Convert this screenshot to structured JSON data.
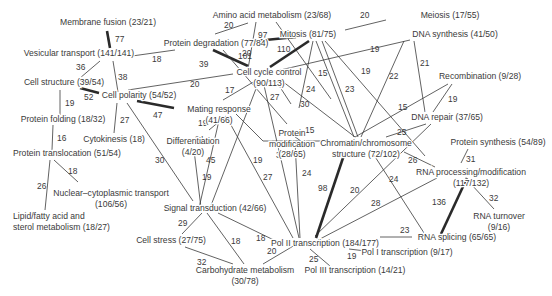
{
  "diagram": {
    "type": "network",
    "nodes": [
      {
        "id": "membrane_fusion",
        "lines": [
          "Membrane fusion (23/21)"
        ],
        "x": 108,
        "y": 25,
        "anchor": "middle"
      },
      {
        "id": "vesicular_transport",
        "lines": [
          "Vesicular transport (141/141)"
        ],
        "x": 79,
        "y": 56,
        "anchor": "middle"
      },
      {
        "id": "cell_structure",
        "lines": [
          "Cell structure (39/54)"
        ],
        "x": 64,
        "y": 85,
        "anchor": "middle"
      },
      {
        "id": "cell_polarity",
        "lines": [
          "Cell polarity (54/52)"
        ],
        "x": 139,
        "y": 98,
        "anchor": "middle"
      },
      {
        "id": "protein_folding",
        "lines": [
          "Protein folding (18/32)"
        ],
        "x": 63,
        "y": 122,
        "anchor": "middle"
      },
      {
        "id": "cytokinesis",
        "lines": [
          "Cytokinesis (18)"
        ],
        "x": 114,
        "y": 142,
        "anchor": "middle"
      },
      {
        "id": "protein_translocation",
        "lines": [
          "Protein translocation (51/54)"
        ],
        "x": 67,
        "y": 156,
        "anchor": "middle"
      },
      {
        "id": "nuclear_cytoplasmic",
        "lines": [
          "Nuclear–cytoplasmic transport",
          "(106/56)"
        ],
        "x": 111,
        "y": 196,
        "anchor": "middle"
      },
      {
        "id": "lipid",
        "lines": [
          "Lipid/fatty acid and",
          "sterol metabolism (18/27)"
        ],
        "x": 13,
        "y": 219,
        "anchor": "start"
      },
      {
        "id": "amino_acid",
        "lines": [
          "Amino acid metabolism (23/68)"
        ],
        "x": 272,
        "y": 18,
        "anchor": "middle"
      },
      {
        "id": "meiosis",
        "lines": [
          "Meiosis (17/55)"
        ],
        "x": 450,
        "y": 18,
        "anchor": "middle"
      },
      {
        "id": "protein_degradation",
        "lines": [
          "Protein degradation (77/84)"
        ],
        "x": 216,
        "y": 46,
        "anchor": "middle"
      },
      {
        "id": "mitosis",
        "lines": [
          "Mitosis (81/75)"
        ],
        "x": 308,
        "y": 37,
        "anchor": "middle"
      },
      {
        "id": "dna_synthesis",
        "lines": [
          "DNA synthesis (41/50)"
        ],
        "x": 455,
        "y": 37,
        "anchor": "middle"
      },
      {
        "id": "cell_cycle_control",
        "lines": [
          "Cell cycle control",
          "(90/113)"
        ],
        "x": 269,
        "y": 75,
        "anchor": "middle"
      },
      {
        "id": "mating_response",
        "lines": [
          "Mating response",
          "(41/66)"
        ],
        "x": 219,
        "y": 112,
        "anchor": "middle"
      },
      {
        "id": "protein_modification",
        "lines": [
          "Protein",
          "modification",
          "(28/65)"
        ],
        "x": 292,
        "y": 136,
        "anchor": "middle"
      },
      {
        "id": "differentiation",
        "lines": [
          "Differentiation",
          "(4/20)"
        ],
        "x": 193,
        "y": 144,
        "anchor": "middle"
      },
      {
        "id": "recombination",
        "lines": [
          "Recombination (9/28)"
        ],
        "x": 480,
        "y": 79,
        "anchor": "middle"
      },
      {
        "id": "dna_repair",
        "lines": [
          "DNA repair (37/65)"
        ],
        "x": 447,
        "y": 120,
        "anchor": "middle"
      },
      {
        "id": "chromatin",
        "lines": [
          "Chromatin/chromosome",
          "structure (72/102)"
        ],
        "x": 366,
        "y": 146,
        "anchor": "middle"
      },
      {
        "id": "protein_synthesis",
        "lines": [
          "Protein synthesis (54/89)"
        ],
        "x": 498,
        "y": 145,
        "anchor": "middle"
      },
      {
        "id": "rna_processing",
        "lines": [
          "RNA processing/modification",
          "(117/132)"
        ],
        "x": 471,
        "y": 175,
        "anchor": "middle"
      },
      {
        "id": "rna_turnover",
        "lines": [
          "RNA turnover",
          "(9/16)"
        ],
        "x": 499,
        "y": 219,
        "anchor": "middle"
      },
      {
        "id": "signal_transduction",
        "lines": [
          "Signal transduction (42/66)"
        ],
        "x": 215,
        "y": 211,
        "anchor": "middle"
      },
      {
        "id": "rna_splicing",
        "lines": [
          "RNA splicing (65/65)"
        ],
        "x": 457,
        "y": 240,
        "anchor": "middle"
      },
      {
        "id": "cell_stress",
        "lines": [
          "Cell stress (27/75)"
        ],
        "x": 171,
        "y": 243,
        "anchor": "middle"
      },
      {
        "id": "pol2",
        "lines": [
          "Pol II transcription (184/177)"
        ],
        "x": 325,
        "y": 246,
        "anchor": "middle"
      },
      {
        "id": "pol1",
        "lines": [
          "Pol I transcription (9/17)"
        ],
        "x": 407,
        "y": 255,
        "anchor": "middle"
      },
      {
        "id": "carbohydrate",
        "lines": [
          "Carbohydrate metabolism",
          "(30/78)"
        ],
        "x": 245,
        "y": 273,
        "anchor": "middle"
      },
      {
        "id": "pol3",
        "lines": [
          "Pol III transcription (14/21)"
        ],
        "x": 355,
        "y": 273,
        "anchor": "middle"
      }
    ],
    "edges": [
      {
        "x1": 107,
        "y1": 31,
        "x2": 110,
        "y2": 48,
        "weight": "77",
        "lx": 115,
        "ly": 42,
        "thick": true
      },
      {
        "x1": 132,
        "y1": 56,
        "x2": 175,
        "y2": 50,
        "weight": "18",
        "lx": 152,
        "ly": 62,
        "thick": false
      },
      {
        "x1": 100,
        "y1": 61,
        "x2": 80,
        "y2": 78,
        "weight": "36",
        "lx": 76,
        "ly": 70,
        "thick": false
      },
      {
        "x1": 113,
        "y1": 61,
        "x2": 118,
        "y2": 92,
        "weight": "38",
        "lx": 118,
        "ly": 80,
        "thick": false
      },
      {
        "x1": 80,
        "y1": 88,
        "x2": 99,
        "y2": 93,
        "weight": "52",
        "lx": 84,
        "ly": 100,
        "thick": true
      },
      {
        "x1": 128,
        "y1": 90,
        "x2": 233,
        "y2": 74,
        "weight": "20",
        "lx": 190,
        "ly": 87,
        "thick": false
      },
      {
        "x1": 60,
        "y1": 90,
        "x2": 60,
        "y2": 115,
        "weight": "19",
        "lx": 65,
        "ly": 106,
        "thick": false
      },
      {
        "x1": 117,
        "y1": 103,
        "x2": 114,
        "y2": 133,
        "weight": "27",
        "lx": 120,
        "ly": 123,
        "thick": false
      },
      {
        "x1": 137,
        "y1": 101,
        "x2": 174,
        "y2": 108,
        "weight": "47",
        "lx": 153,
        "ly": 118,
        "thick": true
      },
      {
        "x1": 127,
        "y1": 103,
        "x2": 193,
        "y2": 201,
        "weight": "30",
        "lx": 155,
        "ly": 163,
        "thick": false
      },
      {
        "x1": 53,
        "y1": 125,
        "x2": 52,
        "y2": 150,
        "weight": "16",
        "lx": 57,
        "ly": 141,
        "thick": false
      },
      {
        "x1": 54,
        "y1": 160,
        "x2": 78,
        "y2": 182,
        "weight": "18",
        "lx": 68,
        "ly": 174,
        "thick": false
      },
      {
        "x1": 50,
        "y1": 160,
        "x2": 45,
        "y2": 210,
        "weight": "26",
        "lx": 37,
        "ly": 189,
        "thick": false
      },
      {
        "x1": 215,
        "y1": 34,
        "x2": 248,
        "y2": 23,
        "weight": "20",
        "lx": 224,
        "ly": 28,
        "thick": false
      },
      {
        "x1": 256,
        "y1": 22,
        "x2": 248,
        "y2": 69,
        "weight": "20",
        "lx": 242,
        "ly": 56,
        "thick": false
      },
      {
        "x1": 276,
        "y1": 22,
        "x2": 331,
        "y2": 99,
        "weight": "",
        "lx": 0,
        "ly": 0,
        "thick": false
      },
      {
        "x1": 255,
        "y1": 41,
        "x2": 296,
        "y2": 37,
        "weight": "97",
        "lx": 258,
        "ly": 38,
        "thick": true
      },
      {
        "x1": 213,
        "y1": 50,
        "x2": 248,
        "y2": 66,
        "weight": "101",
        "lx": 238,
        "ly": 59,
        "thick": true
      },
      {
        "x1": 309,
        "y1": 41,
        "x2": 270,
        "y2": 67,
        "weight": "110",
        "lx": 277,
        "ly": 52,
        "thick": true
      },
      {
        "x1": 386,
        "y1": 20,
        "x2": 345,
        "y2": 30,
        "weight": "20",
        "lx": 360,
        "ly": 18,
        "thick": false
      },
      {
        "x1": 223,
        "y1": 50,
        "x2": 287,
        "y2": 124,
        "weight": "39",
        "lx": 199,
        "ly": 67,
        "thick": false
      },
      {
        "x1": 410,
        "y1": 40,
        "x2": 276,
        "y2": 71,
        "weight": "19",
        "lx": 370,
        "ly": 52,
        "thick": false
      },
      {
        "x1": 313,
        "y1": 41,
        "x2": 299,
        "y2": 108,
        "weight": "24",
        "lx": 306,
        "ly": 92,
        "thick": false
      },
      {
        "x1": 316,
        "y1": 41,
        "x2": 354,
        "y2": 137,
        "weight": "15",
        "lx": 318,
        "ly": 76,
        "thick": false
      },
      {
        "x1": 322,
        "y1": 41,
        "x2": 358,
        "y2": 137,
        "weight": "23",
        "lx": 345,
        "ly": 92,
        "thick": false
      },
      {
        "x1": 325,
        "y1": 41,
        "x2": 425,
        "y2": 156,
        "weight": "19",
        "lx": 361,
        "ly": 74,
        "thick": false
      },
      {
        "x1": 404,
        "y1": 41,
        "x2": 361,
        "y2": 137,
        "weight": "22",
        "lx": 389,
        "ly": 79,
        "thick": false
      },
      {
        "x1": 414,
        "y1": 41,
        "x2": 425,
        "y2": 112,
        "weight": "21",
        "lx": 420,
        "ly": 66,
        "thick": false
      },
      {
        "x1": 255,
        "y1": 81,
        "x2": 223,
        "y2": 100,
        "weight": "17",
        "lx": 225,
        "ly": 93,
        "thick": false
      },
      {
        "x1": 276,
        "y1": 81,
        "x2": 291,
        "y2": 104,
        "weight": "27",
        "lx": 270,
        "ly": 100,
        "thick": false
      },
      {
        "x1": 282,
        "y1": 81,
        "x2": 355,
        "y2": 137,
        "weight": "30",
        "lx": 300,
        "ly": 107,
        "thick": false
      },
      {
        "x1": 259,
        "y1": 81,
        "x2": 210,
        "y2": 208,
        "weight": "19",
        "lx": 253,
        "ly": 163,
        "thick": false
      },
      {
        "x1": 263,
        "y1": 81,
        "x2": 299,
        "y2": 238,
        "weight": "32",
        "lx": 276,
        "ly": 158,
        "thick": false
      },
      {
        "x1": 226,
        "y1": 116,
        "x2": 209,
        "y2": 130,
        "weight": "19",
        "lx": 198,
        "ly": 126,
        "thick": false
      },
      {
        "x1": 220,
        "y1": 116,
        "x2": 199,
        "y2": 208,
        "weight": "45",
        "lx": 206,
        "ly": 163,
        "thick": false
      },
      {
        "x1": 226,
        "y1": 116,
        "x2": 293,
        "y2": 238,
        "weight": "27",
        "lx": 263,
        "ly": 180,
        "thick": false
      },
      {
        "x1": 236,
        "y1": 114,
        "x2": 263,
        "y2": 141,
        "weight": "",
        "lx": 0,
        "ly": 0,
        "thick": false
      },
      {
        "x1": 263,
        "y1": 141,
        "x2": 352,
        "y2": 141,
        "weight": "21",
        "lx": 195,
        "ly": 142,
        "thick": false
      },
      {
        "x1": 291,
        "y1": 134,
        "x2": 305,
        "y2": 144,
        "weight": "15",
        "lx": 305,
        "ly": 133,
        "thick": false
      },
      {
        "x1": 194,
        "y1": 150,
        "x2": 201,
        "y2": 208,
        "weight": "19",
        "lx": 202,
        "ly": 180,
        "thick": false
      },
      {
        "x1": 295,
        "y1": 142,
        "x2": 300,
        "y2": 238,
        "weight": "24",
        "lx": 302,
        "ly": 176,
        "thick": false
      },
      {
        "x1": 448,
        "y1": 84,
        "x2": 355,
        "y2": 137,
        "weight": "15",
        "lx": 398,
        "ly": 110,
        "thick": false
      },
      {
        "x1": 452,
        "y1": 84,
        "x2": 433,
        "y2": 112,
        "weight": "19",
        "lx": 448,
        "ly": 102,
        "thick": false
      },
      {
        "x1": 426,
        "y1": 124,
        "x2": 386,
        "y2": 137,
        "weight": "25",
        "lx": 397,
        "ly": 135,
        "thick": false
      },
      {
        "x1": 431,
        "y1": 124,
        "x2": 315,
        "y2": 236,
        "weight": "20",
        "lx": 350,
        "ly": 193,
        "thick": false
      },
      {
        "x1": 404,
        "y1": 152,
        "x2": 435,
        "y2": 167,
        "weight": "26",
        "lx": 408,
        "ly": 163,
        "thick": false
      },
      {
        "x1": 372,
        "y1": 152,
        "x2": 426,
        "y2": 236,
        "weight": "24",
        "lx": 389,
        "ly": 182,
        "thick": false
      },
      {
        "x1": 345,
        "y1": 152,
        "x2": 316,
        "y2": 238,
        "weight": "98",
        "lx": 318,
        "ly": 191,
        "thick": true
      },
      {
        "x1": 468,
        "y1": 149,
        "x2": 461,
        "y2": 163,
        "weight": "31",
        "lx": 466,
        "ly": 162,
        "thick": false
      },
      {
        "x1": 437,
        "y1": 178,
        "x2": 318,
        "y2": 240,
        "weight": "28",
        "lx": 371,
        "ly": 206,
        "thick": false
      },
      {
        "x1": 467,
        "y1": 178,
        "x2": 441,
        "y2": 234,
        "weight": "136",
        "lx": 432,
        "ly": 205,
        "thick": true
      },
      {
        "x1": 471,
        "y1": 184,
        "x2": 494,
        "y2": 209,
        "weight": "32",
        "lx": 489,
        "ly": 201,
        "thick": false
      },
      {
        "x1": 202,
        "y1": 213,
        "x2": 182,
        "y2": 234,
        "weight": "29",
        "lx": 178,
        "ly": 226,
        "thick": false
      },
      {
        "x1": 207,
        "y1": 213,
        "x2": 244,
        "y2": 264,
        "weight": "18",
        "lx": 231,
        "ly": 244,
        "thick": false
      },
      {
        "x1": 218,
        "y1": 213,
        "x2": 280,
        "y2": 243,
        "weight": "18",
        "lx": 256,
        "ly": 241,
        "thick": false
      },
      {
        "x1": 185,
        "y1": 247,
        "x2": 233,
        "y2": 264,
        "weight": "32",
        "lx": 197,
        "ly": 265,
        "thick": false
      },
      {
        "x1": 295,
        "y1": 245,
        "x2": 263,
        "y2": 264,
        "weight": "20",
        "lx": 267,
        "ly": 254,
        "thick": false
      },
      {
        "x1": 310,
        "y1": 249,
        "x2": 330,
        "y2": 266,
        "weight": "25",
        "lx": 309,
        "ly": 262,
        "thick": false
      },
      {
        "x1": 349,
        "y1": 249,
        "x2": 374,
        "y2": 252,
        "weight": "19",
        "lx": 347,
        "ly": 259,
        "thick": false
      },
      {
        "x1": 380,
        "y1": 237,
        "x2": 412,
        "y2": 237,
        "weight": "23",
        "lx": 400,
        "ly": 233,
        "thick": false
      }
    ]
  }
}
